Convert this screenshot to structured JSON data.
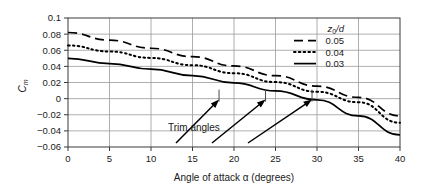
{
  "chart_data": {
    "type": "line",
    "title": "",
    "xlabel": "Angle of attack α (degrees)",
    "ylabel": "C",
    "ylabel_sub": "m",
    "xlim": [
      0,
      40
    ],
    "ylim": [
      -0.06,
      0.1
    ],
    "xticks": [
      "0",
      "5",
      "10",
      "15",
      "20",
      "25",
      "30",
      "35",
      "40"
    ],
    "xtick_values": [
      0,
      5,
      10,
      15,
      20,
      25,
      30,
      35,
      40
    ],
    "yticks": [
      "0.1",
      "0.08",
      "0.06",
      "0.04",
      "0.02",
      "0",
      "−0.02",
      "−0.04",
      "−0.06"
    ],
    "ytick_values": [
      0.1,
      0.08,
      0.06,
      0.04,
      0.02,
      0,
      -0.02,
      -0.04,
      -0.06
    ],
    "grid": true,
    "legend_position": "upper-right",
    "legend_title": "z",
    "legend_title_sub": "0",
    "legend_title_rest": "/d",
    "series": [
      {
        "name": "0.05",
        "style": "dashed",
        "color": "#000000",
        "x": [
          0,
          5,
          10,
          15,
          20,
          25,
          30,
          35,
          40
        ],
        "values": [
          0.082,
          0.0725,
          0.0625,
          0.052,
          0.0405,
          0.0285,
          0.0155,
          0.0015,
          -0.0215
        ]
      },
      {
        "name": "0.04",
        "style": "dotted",
        "color": "#000000",
        "x": [
          0,
          5,
          10,
          15,
          20,
          25,
          30,
          35,
          40
        ],
        "values": [
          0.066,
          0.0585,
          0.0505,
          0.0415,
          0.0315,
          0.0205,
          0.0085,
          -0.0045,
          -0.03
        ]
      },
      {
        "name": "0.03",
        "style": "solid",
        "color": "#000000",
        "x": [
          0,
          5,
          10,
          15,
          20,
          25,
          30,
          35,
          40
        ],
        "values": [
          0.05,
          0.0435,
          0.0365,
          0.0285,
          0.0195,
          0.0095,
          -0.0015,
          -0.0215,
          -0.045
        ]
      }
    ],
    "annotations": [
      {
        "text": "Trim angles",
        "arrows": [
          {
            "to_x": 18.2,
            "to_y": 0.0
          },
          {
            "to_x": 23.8,
            "to_y": 0.0
          },
          {
            "to_x": 29.4,
            "to_y": 0.0
          }
        ]
      }
    ]
  }
}
